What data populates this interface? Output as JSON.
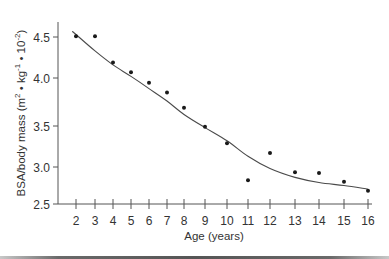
{
  "chart_data": {
    "type": "scatter",
    "title": "",
    "xlabel": "Age (years)",
    "ylabel": "BSA/body mass (m² • kg⁻¹ • 10⁻²)",
    "ylabel_parts": {
      "base": "BSA/body mass (m",
      "sup1": "2",
      "mid1": " • kg",
      "sup2": "-1",
      "mid2": " • 10",
      "sup3": "-2",
      "end": ")"
    },
    "x_ticks": [
      2,
      3,
      4,
      5,
      6,
      7,
      8,
      9,
      10,
      11,
      12,
      13,
      14,
      15,
      16
    ],
    "y_ticks": [
      "2.5",
      "3.0",
      "3.5",
      "4.0",
      "4.5"
    ],
    "xlim": [
      2,
      16
    ],
    "ylim": [
      2.5,
      4.7
    ],
    "grid": false,
    "legend": null,
    "series": [
      {
        "name": "Observed",
        "kind": "points",
        "x": [
          2,
          3,
          4,
          5,
          6,
          7,
          8,
          9,
          10,
          11,
          12,
          13,
          14,
          15,
          16
        ],
        "y": [
          4.51,
          4.51,
          4.19,
          4.07,
          3.95,
          3.85,
          3.69,
          3.49,
          3.29,
          2.82,
          3.17,
          2.93,
          2.92,
          2.8,
          2.68
        ]
      },
      {
        "name": "Fitted curve",
        "kind": "line",
        "x": [
          1.8,
          2,
          3,
          4,
          5,
          6,
          7,
          8,
          9,
          10,
          11,
          12,
          13,
          14,
          15,
          16
        ],
        "y": [
          4.57,
          4.53,
          4.33,
          4.16,
          4.02,
          3.89,
          3.76,
          3.62,
          3.48,
          3.32,
          3.13,
          2.98,
          2.86,
          2.79,
          2.75,
          2.7
        ]
      }
    ]
  }
}
